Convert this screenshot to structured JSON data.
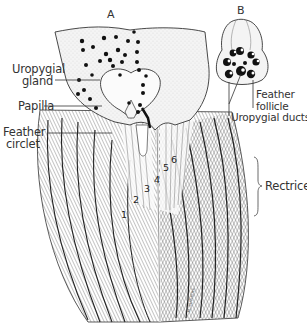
{
  "figure": {
    "panel_a": {
      "letter": "A",
      "labels": {
        "uropygial_gland_line1": "Uropygial",
        "uropygial_gland_line2": "gland",
        "papilla": "Papilla",
        "feather_circlet_line1": "Feather",
        "feather_circlet_line2": "circlet",
        "rectrices": "Rectrices"
      },
      "rectrix_numbers": [
        "1",
        "2",
        "3",
        "4",
        "5",
        "6"
      ]
    },
    "panel_b": {
      "letter": "B",
      "labels": {
        "feather_follicle_line1": "Feather",
        "feather_follicle_line2": "follicle",
        "uropygial_ducts": "Uropygial ducts"
      }
    },
    "signature": "M. SUTHERS"
  },
  "colors": {
    "ink": "#1a1a1a",
    "background": "#ffffff",
    "skin": "#f2f2f2"
  }
}
